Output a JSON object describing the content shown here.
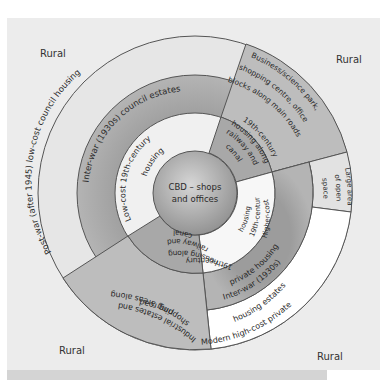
{
  "diagram": {
    "type": "urban land-use model (sector/concentric)",
    "colors": {
      "background": "#ececec",
      "outer_ring": "#e6e6e6",
      "inter_war_ring": "#a9a9a9",
      "inner_ring": "#efefef",
      "sector_mid_gray": "#bdbdbd",
      "cbd": "#a6a6a6",
      "modern_estates": "#ffffff",
      "stroke": "#555555"
    },
    "corner_labels": {
      "top_left": "Rural",
      "top_right": "Rural",
      "bottom_left": "Rural",
      "bottom_right": "Rural"
    },
    "center": {
      "line1": "CBD – shops",
      "line2": "and offices"
    },
    "zones": {
      "post_war": "Post-war (after 1945) low-cost council housing",
      "inter_war_council": "Inter-war (1930s) council estates",
      "low_cost_19th": {
        "line1": "Low-cost 19th-century",
        "line2": "housing"
      },
      "business_park": {
        "line1": "Business/science park,",
        "line2": "shopping centre, office",
        "line3": "blocks along main roads"
      },
      "railway_upper": {
        "line1": "19th-century",
        "line2": "housing along",
        "line3": "railway and",
        "line4": "canal"
      },
      "open_space": {
        "line1": "Large area",
        "line2": "of open",
        "line3": "space"
      },
      "higher_cost_19th": {
        "line1": "Higher-cost",
        "line2": "19th-century",
        "line3": "housing"
      },
      "inter_war_private": {
        "line1": "Inter-war (1930s)",
        "line2": "private housing"
      },
      "modern_private": {
        "line1": "Modern high-cost private",
        "line2": "housing estates"
      },
      "railway_lower": {
        "line1": "19th-century",
        "line2": "housing along",
        "line3": "railway and",
        "line4": "canal"
      },
      "industrial": {
        "line1": "Industrial estates and",
        "line2": "shopping areas along",
        "line3": "ring road"
      }
    }
  }
}
